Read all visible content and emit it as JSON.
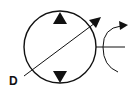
{
  "diagram": {
    "type": "hydraulic-symbol",
    "symbol": "variable-displacement bidirectional pump",
    "label": "D",
    "colors": {
      "stroke": "#111111",
      "background": "#ffffff"
    }
  }
}
